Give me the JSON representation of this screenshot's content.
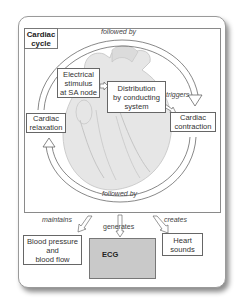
{
  "diagram": {
    "title": "Cardiac\ncycle",
    "title_lines": [
      "Cardiac",
      "cycle"
    ],
    "nodes": {
      "stimulus": [
        "Electrical",
        "stimulus",
        "at SA node"
      ],
      "distribution": [
        "Distribution",
        "by conducting",
        "system"
      ],
      "contraction": [
        "Cardiac",
        "contraction"
      ],
      "relaxation": [
        "Cardiac",
        "relaxation"
      ],
      "blood": [
        "Blood pressure",
        "and",
        "blood flow"
      ],
      "ecg": "ECG",
      "heart_sounds": [
        "Heart",
        "sounds"
      ]
    },
    "edges": {
      "top_followed_by": "followed by",
      "bottom_followed_by": "followed by",
      "triggers": "triggers",
      "maintains": "maintains",
      "generates": "generates",
      "creates": "creates"
    },
    "colors": {
      "border": "#666666",
      "ecg_bg": "#c9c9c9",
      "heart": "#e6e6e6"
    }
  }
}
